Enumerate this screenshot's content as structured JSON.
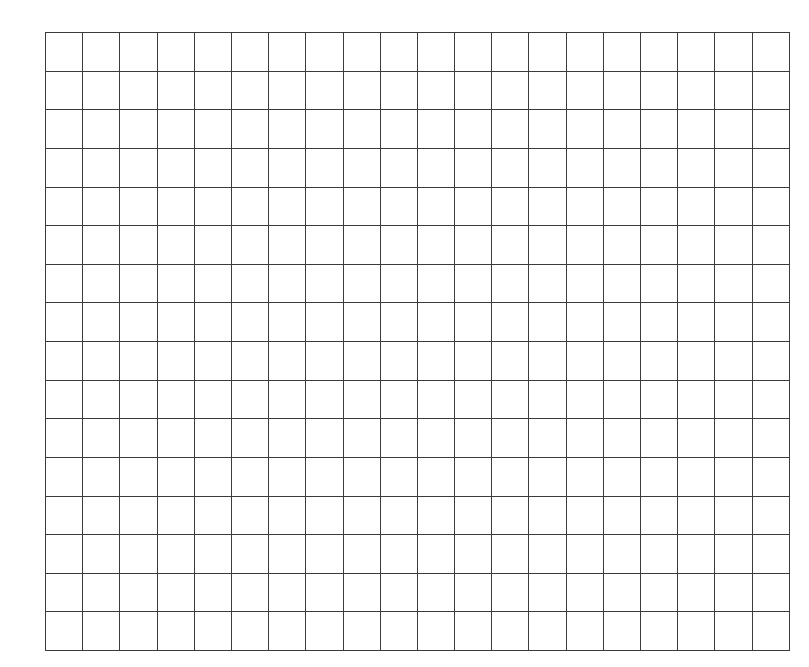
{
  "page": {
    "background_color": "#ffffff",
    "width_px": 809,
    "height_px": 667
  },
  "grid": {
    "name": "blank-graph-grid",
    "columns": 20,
    "rows": 16,
    "origin_x_px": 45,
    "origin_y_px": 32,
    "width_px": 724,
    "height_px": 602,
    "cell_width_px": 36.2,
    "cell_height_px": 37.625,
    "line_color": "#3b3b3b",
    "line_width_px": 1.4,
    "outer_line_width_px": 1.6,
    "cell_fill_color": "#ffffff",
    "cell_labels": [],
    "has_axis_labels": false,
    "has_text": false
  },
  "chart_data": {
    "type": "table",
    "title": "",
    "xlabel": "",
    "ylabel": "",
    "columns": 20,
    "rows": 16,
    "categories": [],
    "values": [],
    "grid": true,
    "legend": null,
    "annotations": []
  }
}
